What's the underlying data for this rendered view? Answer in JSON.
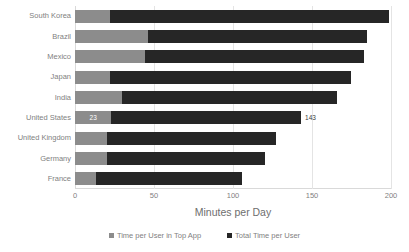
{
  "chart_data": {
    "type": "bar",
    "orientation": "horizontal",
    "stacked": true,
    "title": "",
    "xlabel": "Minutes per Day",
    "ylabel": "",
    "xlim": [
      0,
      200
    ],
    "xticks": [
      0,
      50,
      100,
      150,
      200
    ],
    "xtick_labels": [
      "0",
      "50",
      "100",
      "150",
      "200"
    ],
    "grid": true,
    "grid_axis": "x",
    "legend_position": "bottom-center",
    "categories": [
      "South Korea",
      "Brazil",
      "Mexico",
      "Japan",
      "India",
      "United States",
      "United Kingdom",
      "Germany",
      "France"
    ],
    "series": [
      {
        "name": "Time per User in Top App",
        "color": "#8c8c8c",
        "values": [
          22,
          46,
          44,
          22,
          30,
          23,
          20,
          20,
          13
        ]
      },
      {
        "name": "Total Time per User",
        "color": "#262626",
        "values": [
          199,
          185,
          183,
          175,
          166,
          143,
          127,
          120,
          106
        ]
      }
    ],
    "annotations": [
      {
        "category": "United States",
        "series": "Time per User in Top App",
        "text": "23",
        "placement": "inside"
      },
      {
        "category": "United States",
        "series": "Total Time per User",
        "text": "143",
        "placement": "outside"
      }
    ]
  },
  "axis": {
    "x_title": "Minutes per Day",
    "ticks": [
      "0",
      "50",
      "100",
      "150",
      "200"
    ]
  },
  "legend": {
    "items": [
      {
        "label": "Time per User in Top App",
        "color": "#8c8c8c"
      },
      {
        "label": "Total Time per User",
        "color": "#262626"
      }
    ]
  },
  "colors": {
    "series_top_app": "#8c8c8c",
    "series_total": "#262626",
    "gridline": "#e4e4e4",
    "axis": "#d9d9d9",
    "text": "#7f7f7f",
    "background": "#ffffff"
  }
}
